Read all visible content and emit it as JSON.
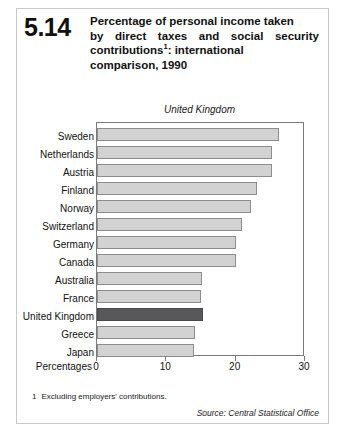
{
  "figure": {
    "number": "5.14",
    "title_lines": [
      "Percentage of personal income taken",
      "by direct taxes and social security",
      "contributions",
      "comparison, 1990"
    ],
    "title_line3_rest": ": international",
    "footnote_marker": "1",
    "footnote_number": "1",
    "footnote_text": "Excluding employers' contributions.",
    "source": "Source: Central Statistical Office",
    "annotation": "United Kingdom"
  },
  "chart_data": {
    "type": "bar",
    "orientation": "horizontal",
    "annotation": "United Kingdom",
    "xlabel": "Percentages",
    "ylabel": "",
    "xlim": [
      0,
      30
    ],
    "xticks": [
      0,
      10,
      20,
      30
    ],
    "xtick_labels": [
      "0",
      "10",
      "20",
      "30"
    ],
    "grid": false,
    "legend": "none",
    "highlight_category": "United Kingdom",
    "colors": {
      "bar": "#d2d2d2",
      "bar_border": "#8c8c8c",
      "highlight": "#58585a",
      "frame": "#7a7a7a"
    },
    "categories": [
      "Sweden",
      "Netherlands",
      "Austria",
      "Finland",
      "Norway",
      "Switzerland",
      "Germany",
      "Canada",
      "Australia",
      "France",
      "United Kingdom",
      "Greece",
      "Japan"
    ],
    "values": [
      26.3,
      25.3,
      25.2,
      23.1,
      22.2,
      20.9,
      20.0,
      20.0,
      15.2,
      15.0,
      15.3,
      14.1,
      14.0
    ],
    "units": "per cent"
  }
}
